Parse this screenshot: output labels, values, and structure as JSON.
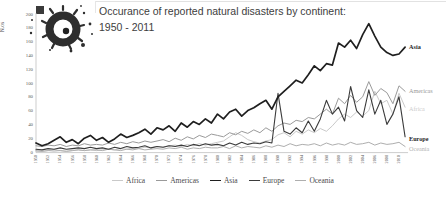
{
  "title": {
    "line1": "Occurance of reported natural disasters by continent:",
    "line2": "1950 - 2011"
  },
  "logo": {
    "icon": "ink-splat-logo"
  },
  "y_axis": {
    "label": "N.os",
    "min": 0,
    "max": 200,
    "tick_step": 20,
    "ticks": [
      0,
      20,
      40,
      60,
      80,
      100,
      120,
      140,
      160,
      180,
      200
    ]
  },
  "x_axis": {
    "tick_years": [
      1950,
      1952,
      1954,
      1956,
      1958,
      1960,
      1962,
      1964,
      1966,
      1968,
      1970,
      1972,
      1974,
      1976,
      1978,
      1980,
      1982,
      1984,
      1986,
      1988,
      1990,
      1992,
      1994,
      1996,
      1998,
      2000,
      2002,
      2004,
      2006,
      2008,
      2010
    ]
  },
  "legend": [
    "Africa",
    "Americas",
    "Asia",
    "Europe",
    "Oceania"
  ],
  "colors": {
    "africa": "#c9c9c9",
    "americas": "#9a9a9a",
    "asia": "#1f1f1f",
    "europe": "#3b3b3b",
    "oceania": "#aeaeae",
    "axis": "#c0c0c0",
    "tick_text": "#595959",
    "title_text": "#3d3d3d"
  },
  "chart_data": {
    "type": "line",
    "title": "Occurance of reported natural disasters by continent: 1950 - 2011",
    "xlabel": "",
    "ylabel": "N.os",
    "ylim": [
      0,
      200
    ],
    "grid": false,
    "legend_position": "bottom",
    "x": [
      1950,
      1951,
      1952,
      1953,
      1954,
      1955,
      1956,
      1957,
      1958,
      1959,
      1960,
      1961,
      1962,
      1963,
      1964,
      1965,
      1966,
      1967,
      1968,
      1969,
      1970,
      1971,
      1972,
      1973,
      1974,
      1975,
      1976,
      1977,
      1978,
      1979,
      1980,
      1981,
      1982,
      1983,
      1984,
      1985,
      1986,
      1987,
      1988,
      1989,
      1990,
      1991,
      1992,
      1993,
      1994,
      1995,
      1996,
      1997,
      1998,
      1999,
      2000,
      2001,
      2002,
      2003,
      2004,
      2005,
      2006,
      2007,
      2008,
      2009,
      2010,
      2011
    ],
    "series": [
      {
        "name": "Africa",
        "color": "#c9c9c9",
        "stroke_width": 1,
        "bold_end_label": false,
        "end_label_color": "#cccccc",
        "values": [
          1,
          1,
          2,
          1,
          2,
          1,
          2,
          3,
          2,
          3,
          2,
          3,
          4,
          3,
          5,
          4,
          6,
          5,
          7,
          6,
          8,
          7,
          9,
          10,
          8,
          11,
          9,
          12,
          10,
          12,
          14,
          16,
          22,
          28,
          24,
          18,
          15,
          13,
          16,
          18,
          25,
          28,
          22,
          30,
          26,
          32,
          28,
          34,
          30,
          38,
          48,
          55,
          50,
          58,
          52,
          60,
          88,
          70,
          75,
          55,
          85,
          65
        ]
      },
      {
        "name": "Americas",
        "color": "#9a9a9a",
        "stroke_width": 1,
        "bold_end_label": false,
        "end_label_color": "#9a9a9a",
        "values": [
          9,
          8,
          10,
          9,
          11,
          8,
          10,
          9,
          12,
          10,
          11,
          10,
          13,
          11,
          14,
          12,
          15,
          13,
          16,
          14,
          16,
          18,
          15,
          20,
          17,
          22,
          19,
          24,
          21,
          26,
          24,
          22,
          28,
          25,
          30,
          27,
          32,
          28,
          35,
          30,
          38,
          42,
          40,
          46,
          44,
          50,
          48,
          55,
          62,
          55,
          78,
          70,
          82,
          72,
          80,
          102,
          82,
          92,
          86,
          70,
          96,
          88
        ]
      },
      {
        "name": "Asia",
        "color": "#1f1f1f",
        "stroke_width": 1.7,
        "bold_end_label": true,
        "end_label_color": "#1f1f1f",
        "values": [
          13,
          9,
          12,
          17,
          22,
          14,
          18,
          12,
          20,
          24,
          17,
          21,
          14,
          19,
          26,
          21,
          24,
          28,
          33,
          26,
          35,
          32,
          38,
          30,
          42,
          36,
          44,
          40,
          48,
          42,
          55,
          48,
          58,
          62,
          52,
          60,
          64,
          70,
          75,
          62,
          80,
          88,
          96,
          104,
          100,
          112,
          125,
          118,
          128,
          126,
          158,
          152,
          162,
          150,
          170,
          186,
          168,
          152,
          144,
          140,
          142,
          152
        ]
      },
      {
        "name": "Europe",
        "color": "#3b3b3b",
        "stroke_width": 1.1,
        "bold_end_label": true,
        "end_label_color": "#1f1f1f",
        "values": [
          4,
          3,
          5,
          4,
          6,
          4,
          5,
          6,
          5,
          7,
          5,
          6,
          4,
          7,
          5,
          8,
          6,
          7,
          9,
          6,
          8,
          7,
          9,
          8,
          10,
          8,
          11,
          9,
          12,
          10,
          11,
          9,
          13,
          10,
          14,
          11,
          13,
          12,
          15,
          13,
          85,
          30,
          26,
          35,
          28,
          45,
          30,
          48,
          75,
          55,
          65,
          45,
          95,
          60,
          50,
          90,
          55,
          75,
          40,
          55,
          80,
          22
        ]
      },
      {
        "name": "Oceania",
        "color": "#aeaeae",
        "stroke_width": 1,
        "bold_end_label": false,
        "end_label_color": "#b3b3b3",
        "values": [
          2,
          1,
          2,
          3,
          2,
          1,
          2,
          3,
          2,
          3,
          3,
          2,
          4,
          3,
          2,
          4,
          3,
          5,
          3,
          4,
          5,
          4,
          6,
          5,
          7,
          4,
          6,
          5,
          7,
          6,
          6,
          8,
          5,
          9,
          6,
          8,
          7,
          6,
          9,
          7,
          10,
          8,
          12,
          9,
          11,
          10,
          12,
          9,
          13,
          10,
          12,
          10,
          14,
          11,
          12,
          14,
          10,
          13,
          11,
          12,
          14,
          8
        ]
      }
    ]
  }
}
